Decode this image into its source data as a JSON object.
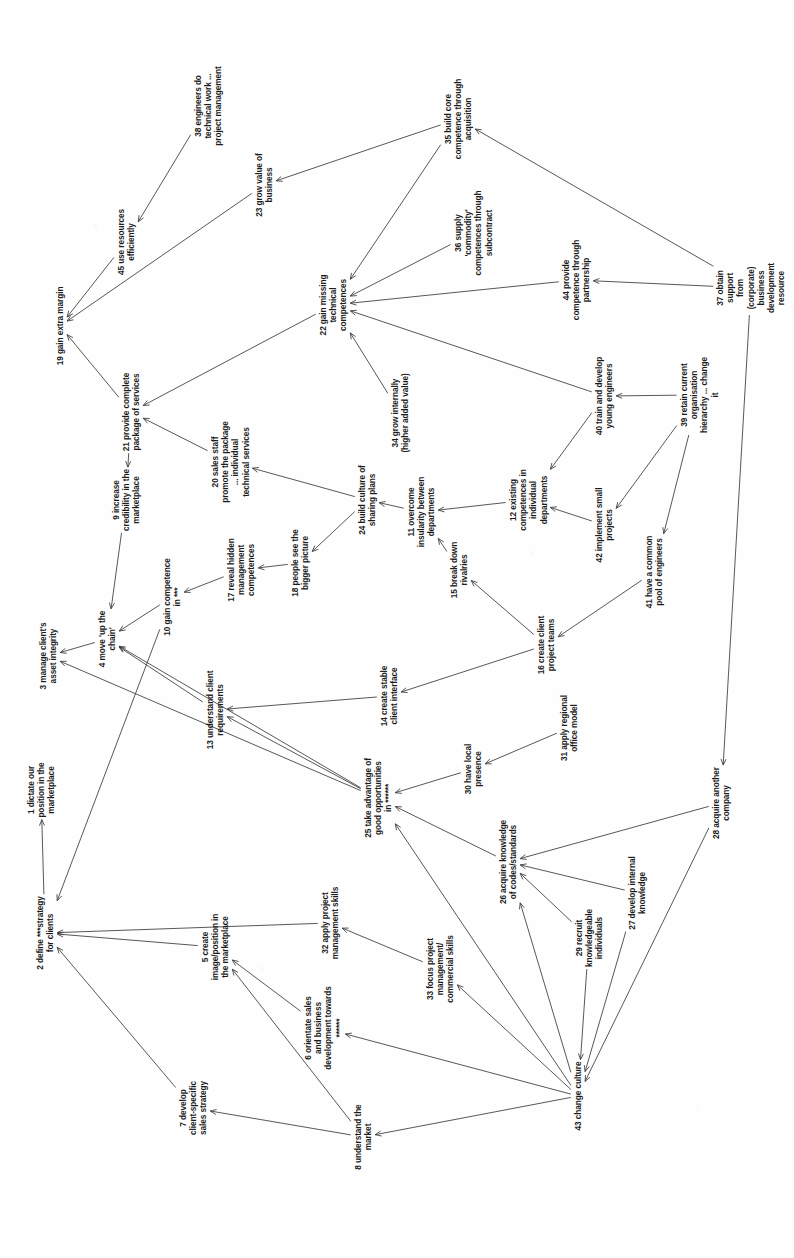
{
  "document": {
    "type": "cognitive-map",
    "orientation": "landscape content rotated 90 degrees clockwise on a portrait page",
    "title": "",
    "node_count": 45,
    "edge_count": 62,
    "ink_color": "#3a3a3a",
    "text_color": "#1b1b1b",
    "background_color": "#fefefe"
  },
  "nodes": [
    {
      "id": 1,
      "label": "1 dictate our\nposition in the\nmarketplace",
      "x": 41,
      "y": 790,
      "rot": -90
    },
    {
      "id": 2,
      "label": "2 define ***strategy\nfor clients",
      "x": 45,
      "y": 933,
      "rot": -90
    },
    {
      "id": 3,
      "label": "3 manage client's\nasset integrity",
      "x": 48,
      "y": 656,
      "rot": -90
    },
    {
      "id": 4,
      "label": "4 move 'up the\nchain'",
      "x": 107,
      "y": 639,
      "rot": -90
    },
    {
      "id": 5,
      "label": "5 create\nimage/position in\nthe marketplace",
      "x": 215,
      "y": 947,
      "rot": -90
    },
    {
      "id": 6,
      "label": "6 orientate sales\nand business\ndevelopment towards\n******",
      "x": 323,
      "y": 1028,
      "rot": -90
    },
    {
      "id": 7,
      "label": "7 develop\nclient-specific\nsales strategy",
      "x": 193,
      "y": 1108,
      "rot": -90
    },
    {
      "id": 8,
      "label": "8 understand the\nmarket",
      "x": 363,
      "y": 1137,
      "rot": -90
    },
    {
      "id": 9,
      "label": "9 increase\ncredibility in the\nmarketplace",
      "x": 126,
      "y": 500,
      "rot": -90
    },
    {
      "id": 10,
      "label": "10 gain competence\nin ***",
      "x": 172,
      "y": 597,
      "rot": -90
    },
    {
      "id": 11,
      "label": "11 overcome\ninsularity between\ndepartments",
      "x": 421,
      "y": 512,
      "rot": -90
    },
    {
      "id": 12,
      "label": "12 existing\ncompetences in\nindividual\ndepartments",
      "x": 528,
      "y": 500,
      "rot": -90
    },
    {
      "id": 13,
      "label": "13 understand client\nrequirements",
      "x": 215,
      "y": 710,
      "rot": -90
    },
    {
      "id": 14,
      "label": "14 create stable\nclient interface",
      "x": 389,
      "y": 696,
      "rot": -90
    },
    {
      "id": 15,
      "label": "15 break down\nrivalries",
      "x": 459,
      "y": 570,
      "rot": -90
    },
    {
      "id": 16,
      "label": "16 create client\nproject teams",
      "x": 546,
      "y": 645,
      "rot": -90
    },
    {
      "id": 17,
      "label": "17 reveal hidden\nmanagement\ncompetences",
      "x": 241,
      "y": 570,
      "rot": -90
    },
    {
      "id": 18,
      "label": "18 people see the\nbigger picture",
      "x": 300,
      "y": 563,
      "rot": -90
    },
    {
      "id": 19,
      "label": "19 gain extra margin",
      "x": 60,
      "y": 326,
      "rot": -90
    },
    {
      "id": 20,
      "label": "20 sales staff\npromote the package\n... individual\ntechnical services",
      "x": 230,
      "y": 462,
      "rot": -90
    },
    {
      "id": 21,
      "label": "21 provide complete\npackage of services",
      "x": 131,
      "y": 412,
      "rot": -90
    },
    {
      "id": 22,
      "label": "22 gain missing\ntechnical\ncompetences",
      "x": 333,
      "y": 305,
      "rot": -90
    },
    {
      "id": 23,
      "label": "23 grow value of\nbusiness",
      "x": 264,
      "y": 185,
      "rot": -90
    },
    {
      "id": 24,
      "label": "24 build culture of\nsharing plans",
      "x": 367,
      "y": 500,
      "rot": -90
    },
    {
      "id": 25,
      "label": "25 take advantage of\ngood opportunities\nin ******",
      "x": 378,
      "y": 798,
      "rot": -90
    },
    {
      "id": 26,
      "label": "26 acquire knowledge\nof codes/standards",
      "x": 508,
      "y": 862,
      "rot": -90
    },
    {
      "id": 27,
      "label": "27 develop internal\nknowledge",
      "x": 637,
      "y": 893,
      "rot": -90
    },
    {
      "id": 28,
      "label": "28 acquire another\ncompany",
      "x": 721,
      "y": 803,
      "rot": -90
    },
    {
      "id": 29,
      "label": "29 recruit\nknowledgeable\nindividuals",
      "x": 589,
      "y": 938,
      "rot": -90
    },
    {
      "id": 30,
      "label": "30 have local\npresence",
      "x": 473,
      "y": 769,
      "rot": -90
    },
    {
      "id": 31,
      "label": "31 apply regional\noffice model",
      "x": 569,
      "y": 728,
      "rot": -90
    },
    {
      "id": 32,
      "label": "32 apply project\nmanagement skills",
      "x": 330,
      "y": 923,
      "rot": -90
    },
    {
      "id": 33,
      "label": "33 focus project\nmanagement/\ncommercial skills",
      "x": 440,
      "y": 969,
      "rot": -90
    },
    {
      "id": 34,
      "label": "34 grow internally\n(higher added value)",
      "x": 400,
      "y": 413,
      "rot": -90
    },
    {
      "id": 35,
      "label": "35 build core\ncompetence through\nacquisition",
      "x": 458,
      "y": 119,
      "rot": -90
    },
    {
      "id": 36,
      "label": "36 supply\n'commodity'\ncompetences through\nsubcontract",
      "x": 473,
      "y": 233,
      "rot": -90
    },
    {
      "id": 37,
      "label": "37 obtain support\nfrom (corporate)\nbusiness development\nresource",
      "x": 751,
      "y": 288,
      "rot": -90
    },
    {
      "id": 38,
      "label": "38 engineers do\ntechnical work ...\nproject management",
      "x": 208,
      "y": 106,
      "rot": -90
    },
    {
      "id": 39,
      "label": "39 retain current\norganisation\nhierarchy ... change\nit",
      "x": 699,
      "y": 395,
      "rot": -90
    },
    {
      "id": 40,
      "label": "40 train and develop\nyoung engineers",
      "x": 604,
      "y": 396,
      "rot": -90
    },
    {
      "id": 41,
      "label": "41 have a common\npool of engineers",
      "x": 654,
      "y": 572,
      "rot": -90
    },
    {
      "id": 42,
      "label": "42 implement small\nprojects",
      "x": 604,
      "y": 525,
      "rot": -90
    },
    {
      "id": 43,
      "label": "43 change culture",
      "x": 578,
      "y": 1096,
      "rot": -90
    },
    {
      "id": 44,
      "label": "44 provide\ncompetence through\npartnership",
      "x": 576,
      "y": 280,
      "rot": -90
    },
    {
      "id": 45,
      "label": "45 use resources\nefficiently",
      "x": 126,
      "y": 242,
      "rot": -90
    }
  ],
  "edges": [
    {
      "from": 38,
      "to": 45
    },
    {
      "from": 45,
      "to": 19
    },
    {
      "from": 23,
      "to": 19
    },
    {
      "from": 35,
      "to": 23
    },
    {
      "from": 35,
      "to": 22
    },
    {
      "from": 36,
      "to": 22
    },
    {
      "from": 44,
      "to": 22
    },
    {
      "from": 37,
      "to": 35
    },
    {
      "from": 37,
      "to": 44
    },
    {
      "from": 37,
      "to": 28
    },
    {
      "from": 34,
      "to": 22
    },
    {
      "from": 40,
      "to": 22
    },
    {
      "from": 22,
      "to": 21
    },
    {
      "from": 21,
      "to": 19
    },
    {
      "from": 21,
      "to": 9
    },
    {
      "from": 20,
      "to": 21
    },
    {
      "from": 9,
      "to": 4
    },
    {
      "from": 10,
      "to": 4
    },
    {
      "from": 17,
      "to": 10
    },
    {
      "from": 18,
      "to": 17
    },
    {
      "from": 24,
      "to": 20
    },
    {
      "from": 24,
      "to": 18
    },
    {
      "from": 11,
      "to": 24
    },
    {
      "from": 12,
      "to": 11
    },
    {
      "from": 15,
      "to": 11
    },
    {
      "from": 40,
      "to": 12
    },
    {
      "from": 42,
      "to": 12
    },
    {
      "from": 39,
      "to": 40
    },
    {
      "from": 39,
      "to": 42
    },
    {
      "from": 39,
      "to": 41
    },
    {
      "from": 16,
      "to": 15
    },
    {
      "from": 41,
      "to": 16
    },
    {
      "from": 16,
      "to": 14
    },
    {
      "from": 4,
      "to": 3
    },
    {
      "from": 13,
      "to": 4
    },
    {
      "from": 14,
      "to": 13
    },
    {
      "from": 25,
      "to": 13
    },
    {
      "from": 25,
      "to": 3
    },
    {
      "from": 30,
      "to": 25
    },
    {
      "from": 31,
      "to": 30
    },
    {
      "from": 26,
      "to": 25
    },
    {
      "from": 27,
      "to": 26
    },
    {
      "from": 29,
      "to": 26
    },
    {
      "from": 28,
      "to": 26
    },
    {
      "from": 32,
      "to": 2
    },
    {
      "from": 33,
      "to": 32
    },
    {
      "from": 6,
      "to": 5
    },
    {
      "from": 8,
      "to": 5
    },
    {
      "from": 8,
      "to": 7
    },
    {
      "from": 7,
      "to": 2
    },
    {
      "from": 5,
      "to": 2
    },
    {
      "from": 2,
      "to": 1
    },
    {
      "from": 43,
      "to": 6
    },
    {
      "from": 43,
      "to": 8
    },
    {
      "from": 43,
      "to": 33
    },
    {
      "from": 43,
      "to": 25
    },
    {
      "from": 43,
      "to": 26
    },
    {
      "from": 29,
      "to": 43
    },
    {
      "from": 27,
      "to": 43
    },
    {
      "from": 28,
      "to": 43
    },
    {
      "from": 25,
      "to": 4
    },
    {
      "from": 10,
      "to": 2
    }
  ]
}
